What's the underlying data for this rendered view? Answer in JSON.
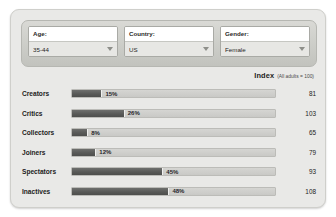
{
  "filters": [
    {
      "label": "Age:",
      "value": "35-44",
      "name": "age"
    },
    {
      "label": "Country:",
      "value": "US",
      "name": "country"
    },
    {
      "label": "Gender:",
      "value": "Female",
      "name": "gender"
    }
  ],
  "index_header": {
    "title": "Index",
    "subtitle": "(All adults = 100)"
  },
  "colors": {
    "bar_fill": "#595a58",
    "bar_track": "#cfcfcc",
    "panel": "#e9e9e7",
    "filter_bar": "#cccdc8"
  },
  "chart_data": {
    "type": "bar",
    "title": "",
    "xlabel": "",
    "ylabel": "",
    "xlim": [
      0,
      100
    ],
    "grid": false,
    "orientation": "horizontal",
    "categories": [
      "Creators",
      "Critics",
      "Collectors",
      "Joiners",
      "Spectators",
      "Inactives"
    ],
    "values": [
      15,
      26,
      8,
      12,
      45,
      48
    ],
    "value_labels": [
      "15%",
      "26%",
      "8%",
      "12%",
      "45%",
      "48%"
    ],
    "index_column_header": "Index",
    "index_values": [
      81,
      103,
      65,
      79,
      93,
      108
    ],
    "rows": [
      {
        "label": "Creators",
        "percent": 15,
        "value_label": "15%",
        "index": "81"
      },
      {
        "label": "Critics",
        "percent": 26,
        "value_label": "26%",
        "index": "103"
      },
      {
        "label": "Collectors",
        "percent": 8,
        "value_label": "8%",
        "index": "65"
      },
      {
        "label": "Joiners",
        "percent": 12,
        "value_label": "12%",
        "index": "79"
      },
      {
        "label": "Spectators",
        "percent": 45,
        "value_label": "45%",
        "index": "93"
      },
      {
        "label": "Inactives",
        "percent": 48,
        "value_label": "48%",
        "index": "108"
      }
    ]
  }
}
